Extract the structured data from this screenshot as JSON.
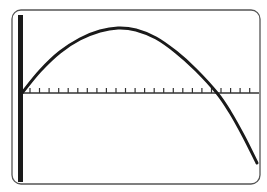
{
  "screen": {
    "frame": {
      "x": 12,
      "y": 10,
      "width": 248,
      "height": 174,
      "radius": 9,
      "stroke": "#555555"
    },
    "y_axis_bar": {
      "x": 18,
      "y": 15,
      "width": 5,
      "height": 167,
      "color": "#1a1a1a"
    },
    "x_axis": {
      "y": 93,
      "x_start": 22,
      "x_end": 259,
      "color": "#333333"
    },
    "ticks": {
      "start": 30,
      "spacing": 9.55,
      "count": 24,
      "length": 5,
      "color": "#333333"
    }
  },
  "chart_data": {
    "type": "line",
    "title": "",
    "xlabel": "",
    "ylabel": "",
    "grid": false,
    "legend": null,
    "x_tick_count": 24,
    "series": [
      {
        "name": "f(x)",
        "color": "#1a1a1a",
        "points_px": [
          [
            22,
            93
          ],
          [
            40,
            71
          ],
          [
            60,
            52
          ],
          [
            80,
            39
          ],
          [
            100,
            31
          ],
          [
            118,
            28
          ],
          [
            136,
            30
          ],
          [
            156,
            38
          ],
          [
            176,
            52
          ],
          [
            196,
            70
          ],
          [
            217,
            93
          ],
          [
            230,
            112
          ],
          [
            244,
            137
          ],
          [
            257,
            163
          ]
        ]
      }
    ],
    "x_axis_crossings_px": [
      22,
      217
    ],
    "peak_px": [
      118,
      28
    ]
  }
}
